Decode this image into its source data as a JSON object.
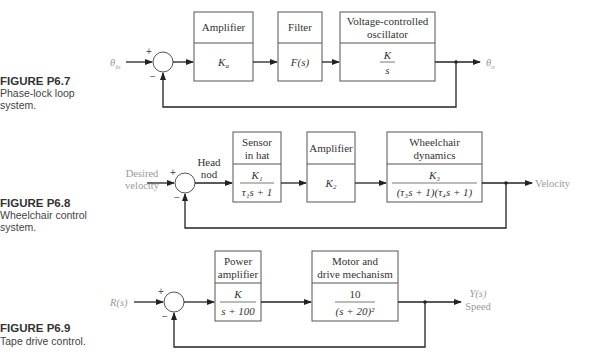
{
  "figures": [
    {
      "id": "P6.7",
      "caption_title": "FIGURE P6.7",
      "caption_lines": [
        "Phase-lock loop",
        "system."
      ],
      "input": {
        "label": "θ",
        "sub": "in"
      },
      "output": {
        "label": "θ",
        "sub": "o"
      },
      "sum_signs": {
        "top": "+",
        "bottom": "−"
      },
      "blocks": [
        {
          "title_lines": [
            "Amplifier"
          ],
          "tf_text": "K",
          "tf_sub": "a"
        },
        {
          "title_lines": [
            "Filter"
          ],
          "tf_text": "F(s)"
        },
        {
          "title_lines": [
            "Voltage-controlled",
            "oscillator"
          ],
          "tf_num": "K",
          "tf_den": "s"
        }
      ]
    },
    {
      "id": "P6.8",
      "caption_title": "FIGURE P6.8",
      "caption_lines": [
        "Wheelchair control",
        "system."
      ],
      "input": {
        "label_lines": [
          "Desired",
          "velocity"
        ]
      },
      "signal_after_sum": [
        "Head",
        "nod"
      ],
      "output": {
        "label": "Velocity"
      },
      "sum_signs": {
        "top": "+",
        "bottom": "−"
      },
      "blocks": [
        {
          "title_lines": [
            "Sensor",
            "in hat"
          ],
          "tf_num": "K₁",
          "tf_den": "τ₁s + 1"
        },
        {
          "title_lines": [
            "Amplifier"
          ],
          "tf_text": "K₂"
        },
        {
          "title_lines": [
            "Wheelchair",
            "dynamics"
          ],
          "tf_num": "K₃",
          "tf_den": "(τ₃s + 1)(τ₄s + 1)"
        }
      ]
    },
    {
      "id": "P6.9",
      "caption_title": "FIGURE P6.9",
      "caption_lines": [
        "Tape drive control."
      ],
      "input": {
        "label": "R(s)"
      },
      "output": {
        "label_lines": [
          "Y(s)",
          "Speed"
        ]
      },
      "sum_signs": {
        "top": "+",
        "bottom": "−"
      },
      "blocks": [
        {
          "title_lines": [
            "Power",
            "amplifier"
          ],
          "tf_num": "K",
          "tf_den": "s + 100"
        },
        {
          "title_lines": [
            "Motor and",
            "drive mechanism"
          ],
          "tf_num": "10",
          "tf_den": "(s + 20)²"
        }
      ]
    }
  ]
}
